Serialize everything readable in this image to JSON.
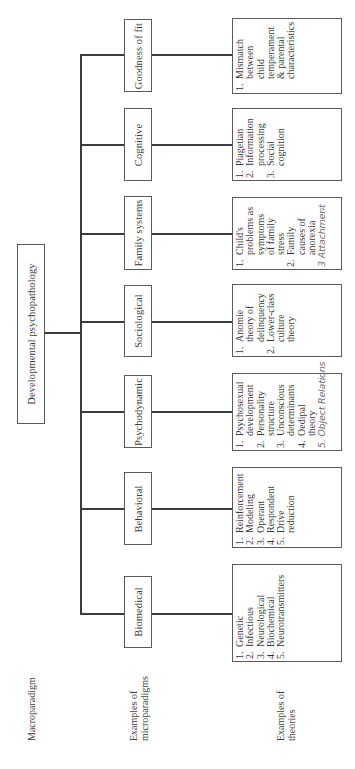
{
  "diagram": {
    "root": {
      "label": "Developmental psychopathology"
    },
    "row_labels": {
      "macroparadigm": "Macroparadigm",
      "microparadigms_line1": "Examples of",
      "microparadigms_line2": "microparadigms",
      "theories_line1": "Examples of",
      "theories_line2": "theories"
    },
    "microparadigms": [
      {
        "label": "Goodness of fit",
        "theories": [
          {
            "num": "1.",
            "lines": [
              "Mismatch",
              "between",
              "child",
              "temperament",
              "& parental",
              "characteristics"
            ]
          }
        ],
        "handwritten_note": ""
      },
      {
        "label": "Cognitive",
        "theories": [
          {
            "num": "1.",
            "lines": [
              "Piagetian"
            ]
          },
          {
            "num": "2.",
            "lines": [
              "Information",
              "processing"
            ]
          },
          {
            "num": "3.",
            "lines": [
              "Social",
              "cognition"
            ]
          }
        ],
        "handwritten_note": ""
      },
      {
        "label": "Family systems",
        "theories": [
          {
            "num": "1.",
            "lines": [
              "Child's",
              "problems as",
              "symptoms",
              "of family",
              "stress"
            ]
          },
          {
            "num": "2.",
            "lines": [
              "Family",
              "causes of",
              "anorexia"
            ]
          }
        ],
        "handwritten_note": "3 Attachment"
      },
      {
        "label": "Sociological",
        "theories": [
          {
            "num": "1.",
            "lines": [
              "Anomie",
              "theory of",
              "delinquency"
            ]
          },
          {
            "num": "2.",
            "lines": [
              "Lower-class",
              "culture",
              "theory"
            ]
          }
        ],
        "handwritten_note": ""
      },
      {
        "label": "Psychodynamic",
        "theories": [
          {
            "num": "1.",
            "lines": [
              "Psychosexual",
              "development"
            ]
          },
          {
            "num": "2.",
            "lines": [
              "Personality",
              "structure"
            ]
          },
          {
            "num": "3.",
            "lines": [
              "Unconscious",
              "determinants"
            ]
          },
          {
            "num": "4.",
            "lines": [
              "Oedipal",
              "theory"
            ]
          }
        ],
        "handwritten_note": "5. Object Relations"
      },
      {
        "label": "Behavioral",
        "theories": [
          {
            "num": "1.",
            "lines": [
              "Reinforcement"
            ]
          },
          {
            "num": "2.",
            "lines": [
              "Modeling"
            ]
          },
          {
            "num": "3.",
            "lines": [
              "Operant"
            ]
          },
          {
            "num": "4.",
            "lines": [
              "Respondent"
            ]
          },
          {
            "num": "5.",
            "lines": [
              "Drive",
              "reduction"
            ]
          }
        ],
        "handwritten_note": ""
      },
      {
        "label": "Biomedical",
        "theories": [
          {
            "num": "1.",
            "lines": [
              "Genetic"
            ]
          },
          {
            "num": "2.",
            "lines": [
              "Infectious"
            ]
          },
          {
            "num": "3.",
            "lines": [
              "Neurological"
            ]
          },
          {
            "num": "4.",
            "lines": [
              "Biochemical"
            ]
          },
          {
            "num": "5.",
            "lines": [
              "Neurotransmitters"
            ]
          }
        ],
        "handwritten_note": ""
      }
    ]
  }
}
